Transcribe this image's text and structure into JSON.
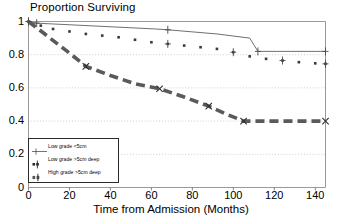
{
  "chart_data": {
    "type": "line",
    "title": "Proportion Surviving",
    "xlabel": "Time from Admission (Months)",
    "ylabel": "",
    "xlim": [
      0,
      145
    ],
    "ylim": [
      0,
      1
    ],
    "xticks": [
      "0",
      "20",
      "40",
      "60",
      "80",
      "100",
      "120",
      "140"
    ],
    "xtick_values": [
      0,
      20,
      40,
      60,
      80,
      100,
      120,
      140
    ],
    "yticks": [
      "0",
      "0.2",
      "0.4",
      "0.6",
      "0.8",
      "1"
    ],
    "ytick_values": [
      0,
      0.2,
      0.4,
      0.6,
      0.8,
      1.0
    ],
    "grid": true,
    "grid_style": "dotted-horizontal",
    "legend_position": "lower-left",
    "series": [
      {
        "name": "Low grade <5cm",
        "style": "solid-thin",
        "marker": "plus",
        "x": [
          0,
          2,
          4,
          62,
          68,
          92,
          108,
          112,
          145
        ],
        "y": [
          1.0,
          0.995,
          0.99,
          0.955,
          0.95,
          0.925,
          0.9,
          0.82,
          0.82
        ],
        "censor_x": [
          0,
          4,
          68,
          112,
          145
        ],
        "censor_y": [
          1.0,
          0.99,
          0.95,
          0.82,
          0.82
        ]
      },
      {
        "name": "Low grade >5cm deep",
        "style": "dotted-square",
        "marker": "plus",
        "x": [
          0,
          6,
          12,
          20,
          28,
          36,
          44,
          52,
          60,
          68,
          76,
          84,
          92,
          100,
          108,
          116,
          124,
          132,
          140,
          145
        ],
        "y": [
          1.0,
          0.975,
          0.955,
          0.94,
          0.925,
          0.915,
          0.905,
          0.89,
          0.875,
          0.865,
          0.855,
          0.845,
          0.835,
          0.815,
          0.79,
          0.775,
          0.765,
          0.755,
          0.748,
          0.745
        ],
        "censor_x": [
          0,
          68,
          100,
          124,
          145
        ],
        "censor_y": [
          1.0,
          0.865,
          0.815,
          0.765,
          0.745
        ]
      },
      {
        "name": "High grade >5cm deep",
        "style": "dashed-thick",
        "marker": "x",
        "x": [
          0,
          10,
          20,
          28,
          40,
          52,
          64,
          76,
          88,
          96,
          105,
          112,
          124,
          136,
          145
        ],
        "y": [
          1.0,
          0.905,
          0.81,
          0.73,
          0.675,
          0.625,
          0.595,
          0.545,
          0.49,
          0.445,
          0.4,
          0.4,
          0.4,
          0.4,
          0.4
        ],
        "censor_x": [
          28,
          64,
          88,
          105,
          145
        ],
        "censor_y": [
          0.73,
          0.595,
          0.49,
          0.4,
          0.4
        ]
      }
    ]
  },
  "legend": {
    "items": [
      {
        "label": "Low grade <5cm"
      },
      {
        "label": "Low grade >5cm deep"
      },
      {
        "label": "High grade >5cm deep"
      }
    ]
  }
}
